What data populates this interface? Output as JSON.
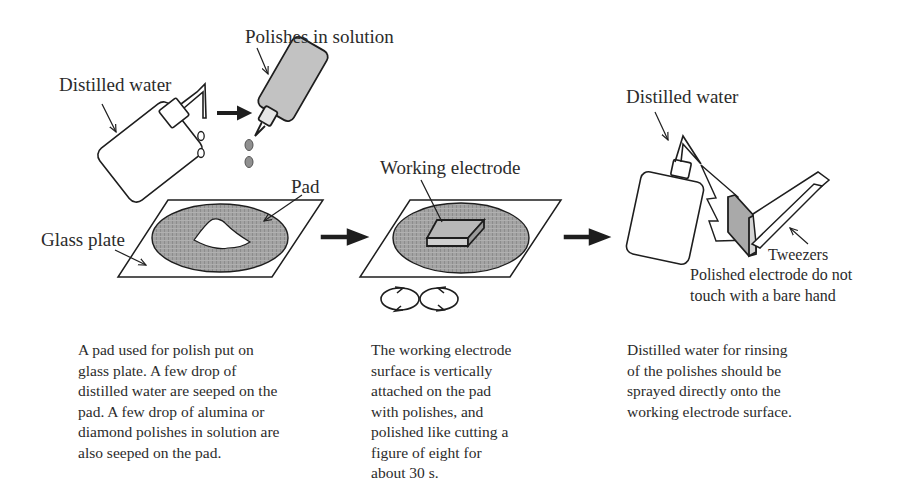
{
  "diagram": {
    "step1": {
      "labels": {
        "distilled_water": "Distilled water",
        "polishes_in_solution": "Polishes in solution",
        "pad": "Pad",
        "glass_plate": "Glass plate"
      },
      "description": "A pad used for polish put on\nglass plate. A few drop of\ndistilled water are seeped on the\npad. A few drop of  alumina or\ndiamond polishes in solution are\nalso seeped on the pad."
    },
    "step2": {
      "labels": {
        "working_electrode": "Working electrode"
      },
      "description": "The working electrode\nsurface is vertically\nattached on the pad\nwith polishes, and\npolished  like cutting a\nfigure of eight for\nabout 30 s."
    },
    "step3": {
      "labels": {
        "distilled_water": "Distilled water",
        "tweezers": "Tweezers",
        "note": "Polished electrode do not\ntouch with a bare hand"
      },
      "description": "Distilled water for rinsing\nof the polishes should be\nsprayed directly onto the\nworking electrode surface."
    },
    "colors": {
      "stroke": "#1e1e1e",
      "pad_fill": "#9a9a9a",
      "polish_bottle_fill": "#bdbdbd",
      "electrode_top": "#b5b5b5",
      "background": "#ffffff"
    }
  }
}
